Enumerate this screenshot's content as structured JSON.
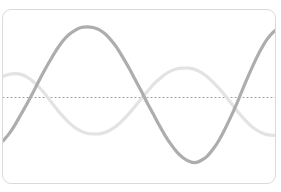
{
  "card": {
    "background_color": "#ffffff",
    "border_color": "#dadada",
    "corner_radius": 9
  },
  "chart_data": {
    "type": "line",
    "title": "",
    "subtitle": "",
    "xlabel": "",
    "ylabel": "",
    "grid": false,
    "legend_position": "none",
    "axis_visible": false,
    "tick_labels_x": [],
    "tick_labels_y": [],
    "xlim": [
      0,
      274
    ],
    "ylim": [
      -1.25,
      1.25
    ],
    "baseline": {
      "name": "zero-axis",
      "value": 0,
      "style": "dotted",
      "color": "#9a9a9a",
      "dot_size": 1,
      "dot_gap": 3,
      "y_pixel": 108
    },
    "series": [
      {
        "name": "wave-primary",
        "color": "#a9a9a9",
        "line_width": 3.2,
        "opacity": 0.95,
        "amplitude": 1.0,
        "period_px": 184,
        "phase_px": 38,
        "description": "higher amplitude sinusoid, peak near x=95, trough near x=188",
        "points": [
          [
            0,
            -0.62
          ],
          [
            6,
            -0.52
          ],
          [
            12,
            -0.39
          ],
          [
            18,
            -0.24
          ],
          [
            24,
            -0.09
          ],
          [
            30,
            0.07
          ],
          [
            36,
            0.24
          ],
          [
            42,
            0.4
          ],
          [
            48,
            0.55
          ],
          [
            54,
            0.69
          ],
          [
            60,
            0.81
          ],
          [
            66,
            0.9
          ],
          [
            72,
            0.96
          ],
          [
            78,
            1.0
          ],
          [
            84,
            1.01
          ],
          [
            90,
            1.0
          ],
          [
            96,
            0.97
          ],
          [
            102,
            0.91
          ],
          [
            108,
            0.82
          ],
          [
            114,
            0.71
          ],
          [
            120,
            0.57
          ],
          [
            126,
            0.42
          ],
          [
            132,
            0.26
          ],
          [
            138,
            0.1
          ],
          [
            144,
            -0.07
          ],
          [
            150,
            -0.23
          ],
          [
            156,
            -0.39
          ],
          [
            162,
            -0.54
          ],
          [
            168,
            -0.67
          ],
          [
            174,
            -0.78
          ],
          [
            180,
            -0.86
          ],
          [
            186,
            -0.91
          ],
          [
            192,
            -0.93
          ],
          [
            198,
            -0.9
          ],
          [
            204,
            -0.84
          ],
          [
            210,
            -0.74
          ],
          [
            216,
            -0.61
          ],
          [
            222,
            -0.45
          ],
          [
            228,
            -0.27
          ],
          [
            234,
            -0.08
          ],
          [
            240,
            0.13
          ],
          [
            246,
            0.33
          ],
          [
            252,
            0.52
          ],
          [
            258,
            0.69
          ],
          [
            264,
            0.83
          ],
          [
            270,
            0.93
          ],
          [
            274,
            0.98
          ]
        ]
      },
      {
        "name": "wave-secondary",
        "color": "#e2e2e2",
        "line_width": 3.2,
        "opacity": 0.95,
        "amplitude": 0.45,
        "period_px": 184,
        "phase_px": -55,
        "description": "lower amplitude sinusoid, local peak near x=8 and x=188, trough near x=95",
        "points": [
          [
            0,
            0.3
          ],
          [
            6,
            0.33
          ],
          [
            12,
            0.34
          ],
          [
            18,
            0.33
          ],
          [
            24,
            0.29
          ],
          [
            30,
            0.23
          ],
          [
            36,
            0.15
          ],
          [
            42,
            0.05
          ],
          [
            48,
            -0.06
          ],
          [
            54,
            -0.17
          ],
          [
            60,
            -0.27
          ],
          [
            66,
            -0.36
          ],
          [
            72,
            -0.43
          ],
          [
            78,
            -0.48
          ],
          [
            84,
            -0.51
          ],
          [
            90,
            -0.52
          ],
          [
            96,
            -0.52
          ],
          [
            102,
            -0.5
          ],
          [
            108,
            -0.46
          ],
          [
            114,
            -0.4
          ],
          [
            120,
            -0.32
          ],
          [
            126,
            -0.23
          ],
          [
            132,
            -0.13
          ],
          [
            138,
            -0.02
          ],
          [
            144,
            0.08
          ],
          [
            150,
            0.18
          ],
          [
            156,
            0.26
          ],
          [
            162,
            0.33
          ],
          [
            168,
            0.38
          ],
          [
            174,
            0.41
          ],
          [
            180,
            0.42
          ],
          [
            186,
            0.42
          ],
          [
            192,
            0.4
          ],
          [
            198,
            0.36
          ],
          [
            204,
            0.3
          ],
          [
            210,
            0.22
          ],
          [
            216,
            0.13
          ],
          [
            222,
            0.03
          ],
          [
            228,
            -0.08
          ],
          [
            234,
            -0.19
          ],
          [
            240,
            -0.29
          ],
          [
            246,
            -0.38
          ],
          [
            252,
            -0.45
          ],
          [
            258,
            -0.5
          ],
          [
            264,
            -0.53
          ],
          [
            270,
            -0.54
          ],
          [
            274,
            -0.54
          ]
        ]
      }
    ],
    "intersections": [
      {
        "x": 38,
        "y": 0.22
      },
      {
        "x": 140,
        "y": 0.02
      },
      {
        "x": 221,
        "y": 0.05
      }
    ]
  }
}
